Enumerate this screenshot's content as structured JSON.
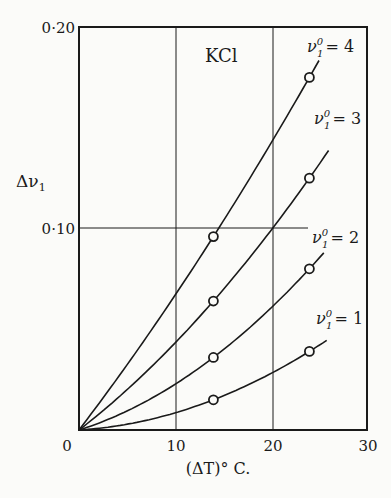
{
  "chart_data": {
    "type": "line",
    "title": "KCl",
    "xlabel": "(ΔT)° C.",
    "ylabel": "Δν₁",
    "xlim": [
      0,
      30
    ],
    "ylim": [
      0,
      0.2
    ],
    "x_ticks": [
      "0",
      "10",
      "20",
      "30"
    ],
    "y_ticks": [
      "0",
      "0·10",
      "0·20"
    ],
    "grid": {
      "vertical": [
        10,
        20
      ],
      "horizontal": [
        0.1
      ]
    },
    "series": [
      {
        "name": "ν₁⁰ = 4",
        "points": [
          [
            0,
            0
          ],
          [
            14,
            0.096
          ],
          [
            24,
            0.175
          ]
        ],
        "curve_end": [
          25,
          0.182
        ]
      },
      {
        "name": "ν₁⁰ = 3",
        "points": [
          [
            0,
            0
          ],
          [
            14,
            0.064
          ],
          [
            24,
            0.125
          ]
        ],
        "curve_end": [
          26,
          0.143
        ]
      },
      {
        "name": "ν₁⁰ = 2",
        "points": [
          [
            0,
            0
          ],
          [
            14,
            0.036
          ],
          [
            24,
            0.08
          ]
        ],
        "curve_end": [
          25.5,
          0.092
        ]
      },
      {
        "name": "ν₁⁰ = 1",
        "points": [
          [
            0,
            0
          ],
          [
            14,
            0.015
          ],
          [
            24,
            0.039
          ]
        ],
        "curve_end": [
          25.8,
          0.046
        ]
      }
    ]
  },
  "labels": {
    "title": "KCl",
    "ylabel_main": "Δν",
    "ylabel_sub": "1",
    "xlabel": "(ΔT)° C.",
    "y_ticks": [
      "0",
      "0·10",
      "0·20"
    ],
    "x_ticks": [
      "10",
      "20",
      "30"
    ],
    "series_labels": [
      {
        "nu": "ν",
        "sup": "0",
        "sub": "1",
        "eq": "= 4"
      },
      {
        "nu": "ν",
        "sup": "0",
        "sub": "1",
        "eq": "= 3"
      },
      {
        "nu": "ν",
        "sup": "0",
        "sub": "1",
        "eq": "= 2"
      },
      {
        "nu": "ν",
        "sup": "0",
        "sub": "1",
        "eq": "= 1"
      }
    ]
  }
}
